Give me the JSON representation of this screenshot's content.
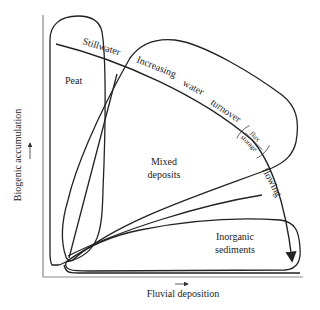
{
  "diagram": {
    "axes": {
      "x_label": "Fluvial deposition",
      "y_label": "Biogenic accumulation"
    },
    "regions": {
      "peat": "Peat",
      "mixed_line1": "Mixed",
      "mixed_line2": "deposits",
      "inorganic_line1": "Inorganic",
      "inorganic_line2": "sediments"
    },
    "gradient": {
      "w1": "Stillwater",
      "w2": "Increasing",
      "w3": "water",
      "w4": "turnover",
      "frac_num": "flux",
      "frac_den": "storage",
      "w5": "flowing"
    },
    "colors": {
      "line": "#222222",
      "axis": "#888888"
    }
  }
}
